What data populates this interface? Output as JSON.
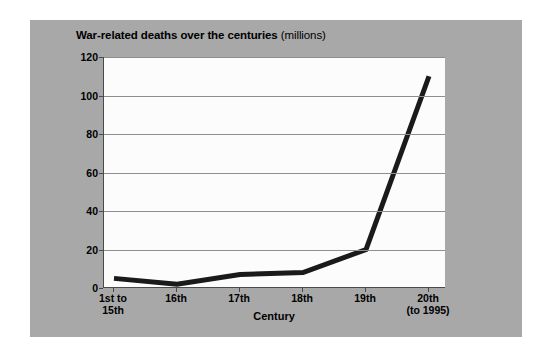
{
  "card": {
    "background_color": "#a8a8a8",
    "plot_background_color": "#fcfcfc",
    "axis_color": "#4a4a4a",
    "gridline_color": "#8e8e8e",
    "line_color": "#1a1a1a"
  },
  "title": {
    "main": "War-related deaths over the centuries",
    "unit": "(millions)"
  },
  "chart_data": {
    "type": "line",
    "title": "War-related deaths over the centuries (millions)",
    "xlabel": "Century",
    "ylabel": "",
    "categories": [
      "1st to 15th",
      "16th",
      "17th",
      "18th",
      "19th",
      "20th (to 1995)"
    ],
    "category_lines": [
      [
        "1st to",
        "15th"
      ],
      [
        "16th",
        ""
      ],
      [
        "17th",
        ""
      ],
      [
        "18th",
        ""
      ],
      [
        "19th",
        ""
      ],
      [
        "20th",
        "(to 1995)"
      ]
    ],
    "values": [
      5,
      2,
      7,
      8,
      20,
      110
    ],
    "ylim": [
      0,
      120
    ],
    "yticks": [
      0,
      20,
      40,
      60,
      80,
      100,
      120
    ],
    "ytick_labels": [
      "0",
      "20",
      "40",
      "60",
      "80",
      "100",
      "120"
    ],
    "grid": true,
    "grid_axis": "y",
    "legend": false,
    "line_width_px": 5
  }
}
